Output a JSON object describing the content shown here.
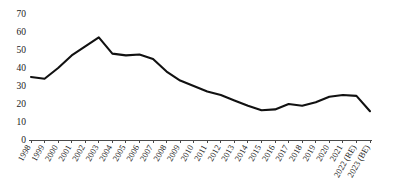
{
  "chart_data": {
    "type": "line",
    "title": "",
    "subtitle": "",
    "xlabel": "",
    "ylabel": "",
    "categories": [
      "1998",
      "1999",
      "2000",
      "2001",
      "2002",
      "2003",
      "2004",
      "2005",
      "2006",
      "2007",
      "2008",
      "2009",
      "2010",
      "2011",
      "2012",
      "2013",
      "2014",
      "2015",
      "2016",
      "2017",
      "2018",
      "2019",
      "2020",
      "2021",
      "2022 (RE)",
      "2023 (BE)"
    ],
    "values": [
      35,
      34,
      40,
      47,
      52,
      57,
      48,
      47,
      47.5,
      45,
      38,
      33,
      30,
      27,
      25,
      22,
      19,
      16.5,
      17,
      20,
      19,
      21,
      24,
      25,
      24.5,
      16
    ],
    "series": [
      {
        "name": "Series 1",
        "values": [
          35,
          34,
          40,
          47,
          52,
          57,
          48,
          47,
          47.5,
          45,
          38,
          33,
          30,
          27,
          25,
          22,
          19,
          16.5,
          17,
          20,
          19,
          21,
          24,
          25,
          24.5,
          16
        ],
        "color": "#111111"
      }
    ],
    "ylim": [
      0,
      70
    ],
    "yticks": [
      0,
      10,
      20,
      30,
      40,
      50,
      60,
      70
    ],
    "ytick_labels": [
      "0",
      "10",
      "20",
      "30",
      "40",
      "50",
      "60",
      "70"
    ],
    "grid": false,
    "legend": false,
    "legend_position": "none",
    "annotations": []
  },
  "axes": {
    "y_tick_labels": [
      "70",
      "60",
      "50",
      "40",
      "30",
      "20",
      "10",
      "0"
    ],
    "x_tick_labels": [
      "1998",
      "1999",
      "2000",
      "2001",
      "2002",
      "2003",
      "2004",
      "2005",
      "2006",
      "2007",
      "2008",
      "2009",
      "2010",
      "2011",
      "2012",
      "2013",
      "2014",
      "2015",
      "2016",
      "2017",
      "2018",
      "2019",
      "2020",
      "2021",
      "2022 (RE)",
      "2023 (BE)"
    ]
  },
  "colors": {
    "line": "#111111",
    "axis": "#4a4a4a",
    "text": "#1a1a1a",
    "background": "#ffffff"
  }
}
